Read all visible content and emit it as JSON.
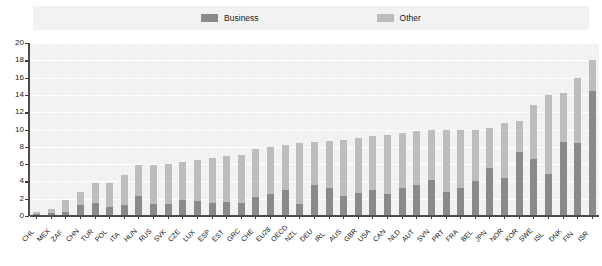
{
  "legend": {
    "items": [
      {
        "label": "Business",
        "color": "#8a8a8a",
        "name": "business"
      },
      {
        "label": "Other",
        "color": "#bdbdbd",
        "name": "other"
      }
    ]
  },
  "axis": {
    "y_ticks": [
      "0",
      "2",
      "4",
      "6",
      "8",
      "10",
      "12",
      "14",
      "16",
      "18",
      "20"
    ]
  },
  "chart_data": {
    "type": "bar",
    "title": "",
    "subtitle": "",
    "xlabel": "",
    "ylabel": "",
    "ylim": [
      0,
      20
    ],
    "ytick_step": 2,
    "grid": true,
    "stacked": true,
    "legend_position": "top-center",
    "categories": [
      "CHL",
      "MEX",
      "ZAF",
      "CHN",
      "TUR",
      "POL",
      "ITA",
      "HUN",
      "RUS",
      "SVK",
      "CZE",
      "LUX",
      "ESP",
      "EST",
      "GRC",
      "CHE",
      "EU28",
      "OECD",
      "NZL",
      "DEU",
      "IRL",
      "AUS",
      "GBR",
      "USA",
      "CAN",
      "NLD",
      "AUT",
      "SVN",
      "PRT",
      "FRA",
      "BEL",
      "JPN",
      "NOR",
      "KOR",
      "SWE",
      "ISL",
      "DNK",
      "FIN",
      "ISR"
    ],
    "series": [
      {
        "name": "Business",
        "color": "#8a8a8a",
        "values": [
          0.2,
          0.3,
          0.5,
          1.3,
          1.5,
          1.1,
          1.3,
          2.3,
          1.4,
          1.4,
          1.9,
          1.7,
          1.5,
          1.6,
          1.5,
          2.2,
          2.6,
          3.0,
          1.4,
          3.6,
          3.2,
          2.3,
          2.7,
          3.0,
          2.5,
          3.2,
          3.6,
          4.2,
          2.8,
          3.2,
          4.1,
          5.6,
          4.4,
          7.4,
          6.6,
          4.8,
          8.6,
          8.4,
          14.5
        ]
      },
      {
        "name": "Other",
        "color": "#bdbdbd",
        "values": [
          0.3,
          0.5,
          1.3,
          1.5,
          2.3,
          2.7,
          3.5,
          3.6,
          4.5,
          4.6,
          4.3,
          4.8,
          5.2,
          5.3,
          5.6,
          5.6,
          5.4,
          5.2,
          7.0,
          5.0,
          5.5,
          6.5,
          6.3,
          6.2,
          6.9,
          6.4,
          6.2,
          5.8,
          7.2,
          6.8,
          5.9,
          4.6,
          6.3,
          3.6,
          6.2,
          9.2,
          5.6,
          7.6,
          3.5
        ]
      }
    ],
    "totals": [
      0.5,
      0.8,
      1.8,
      2.8,
      3.8,
      3.8,
      4.8,
      5.9,
      5.9,
      6.0,
      6.2,
      6.5,
      6.7,
      6.9,
      7.1,
      7.8,
      8.0,
      8.2,
      8.4,
      8.6,
      8.7,
      8.8,
      9.0,
      9.2,
      9.4,
      9.6,
      9.8,
      10.0,
      10.0,
      10.0,
      10.0,
      10.2,
      10.7,
      11.0,
      12.8,
      14.0,
      14.2,
      16.0,
      18.0
    ]
  }
}
